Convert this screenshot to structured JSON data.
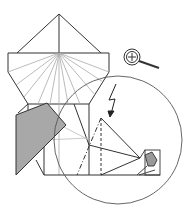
{
  "diagram": {
    "type": "origami-fold-diagram",
    "colors": {
      "line": "#333333",
      "light_line": "#aaaaaa",
      "fill_gray": "#a8a8a8",
      "background": "#ffffff"
    },
    "symbols": [
      "magnifier-icon",
      "lightning-arrow-icon",
      "circle-zoom-callout",
      "detail-box"
    ],
    "line_styles": [
      "solid",
      "dashed",
      "dash-dot"
    ]
  }
}
